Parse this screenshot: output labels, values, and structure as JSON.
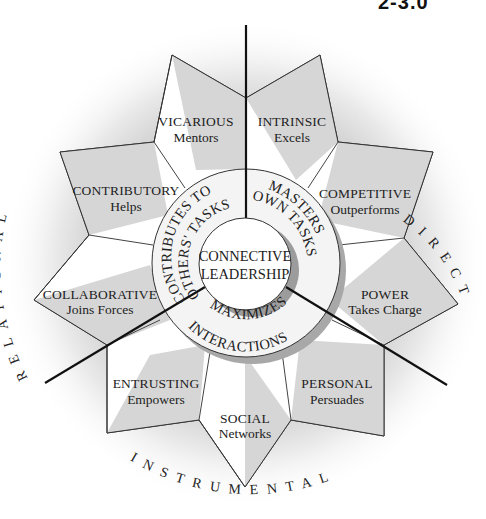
{
  "corner_text": "2-3.0",
  "center": {
    "line1": "CONNECTIVE",
    "line2": "LEADERSHIP"
  },
  "ring": {
    "contributes": {
      "line1": "CONTRIBUTES TO",
      "line2": "OTHERS' TASKS"
    },
    "masters": {
      "line1": "MASTERS",
      "line2": "OWN TASKS"
    },
    "maximizes": {
      "line1": "MAXIMIZES",
      "line2": "INTERACTIONS"
    }
  },
  "domains": {
    "relational": "RELATIONAL",
    "direct": "DIRECT",
    "instrumental": "INSTRUMENTAL"
  },
  "styles": [
    {
      "title": "VICARIOUS",
      "subtitle": "Mentors"
    },
    {
      "title": "INTRINSIC",
      "subtitle": "Excels"
    },
    {
      "title": "COMPETITIVE",
      "subtitle": "Outperforms"
    },
    {
      "title": "POWER",
      "subtitle": "Takes Charge"
    },
    {
      "title": "PERSONAL",
      "subtitle": "Persuades"
    },
    {
      "title": "SOCIAL",
      "subtitle": "Networks"
    },
    {
      "title": "ENTRUSTING",
      "subtitle": "Empowers"
    },
    {
      "title": "COLLABORATIVE",
      "subtitle": "Joins Forces"
    },
    {
      "title": "CONTRIBUTORY",
      "subtitle": "Helps"
    }
  ],
  "colors": {
    "petal_shade": "#d9d9d9",
    "line": "#111111",
    "ring_shadow": "#a8a8a8"
  }
}
